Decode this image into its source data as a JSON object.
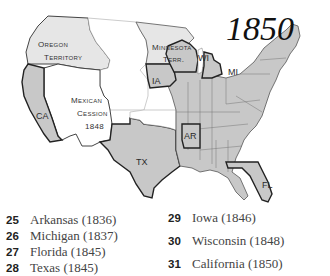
{
  "title": "1850",
  "territory_labels": {
    "oregon_line1": "Oregon",
    "oregon_line2": "Territory",
    "minnesota_line1": "Minnesota",
    "minnesota_line2": "Terr.",
    "mexican_line1": "Mexican",
    "mexican_line2": "Cession",
    "mexican_line3": "1848"
  },
  "state_labels": {
    "ca": "CA",
    "tx": "TX",
    "ar": "AR",
    "ia": "IA",
    "wi": "WI",
    "mi": "MI",
    "fl": "FL"
  },
  "colors": {
    "state_fill": "#c8c8c8",
    "territory_fill": "#e6e6e6",
    "unorganized_fill": "#ffffff",
    "border": "#555555",
    "highlight_border": "#222222"
  },
  "legend": {
    "left": [
      {
        "number": "25",
        "label": "Arkansas (1836)"
      },
      {
        "number": "26",
        "label": "Michigan (1837)"
      },
      {
        "number": "27",
        "label": "Florida (1845)"
      },
      {
        "number": "28",
        "label": "Texas (1845)"
      }
    ],
    "right": [
      {
        "number": "29",
        "label": "Iowa (1846)"
      },
      {
        "number": "30",
        "label": "Wisconsin (1848)"
      },
      {
        "number": "31",
        "label": "California (1850)"
      }
    ]
  }
}
